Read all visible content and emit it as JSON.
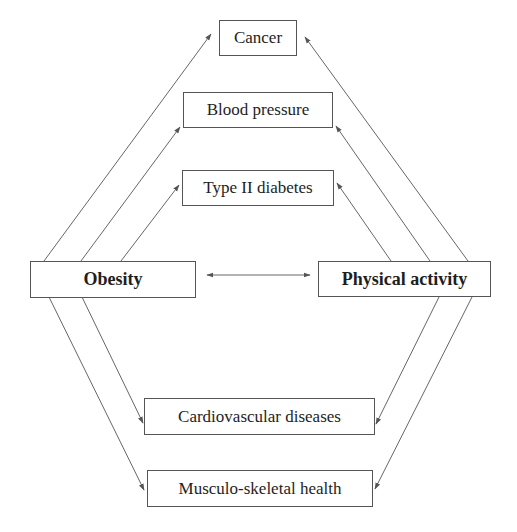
{
  "diagram": {
    "center_nodes": {
      "obesity": "Obesity",
      "physical_activity": "Physical activity"
    },
    "outcomes": {
      "cancer": "Cancer",
      "blood_pressure": "Blood pressure",
      "type2_diabetes": "Type II diabetes",
      "cardiovascular": "Cardiovascular diseases",
      "musculoskeletal": "Musculo-skeletal health"
    },
    "edges": [
      {
        "from": "Obesity",
        "to": "Physical activity",
        "type": "bidirectional"
      },
      {
        "from": "Obesity",
        "to": "Cancer"
      },
      {
        "from": "Obesity",
        "to": "Blood pressure"
      },
      {
        "from": "Obesity",
        "to": "Type II diabetes"
      },
      {
        "from": "Obesity",
        "to": "Cardiovascular diseases"
      },
      {
        "from": "Obesity",
        "to": "Musculo-skeletal health"
      },
      {
        "from": "Physical activity",
        "to": "Cancer"
      },
      {
        "from": "Physical activity",
        "to": "Blood pressure"
      },
      {
        "from": "Physical activity",
        "to": "Type II diabetes"
      },
      {
        "from": "Physical activity",
        "to": "Cardiovascular diseases"
      },
      {
        "from": "Physical activity",
        "to": "Musculo-skeletal health"
      }
    ],
    "colors": {
      "line": "#555555",
      "text": "#1e1e1e",
      "background": "#ffffff"
    }
  }
}
